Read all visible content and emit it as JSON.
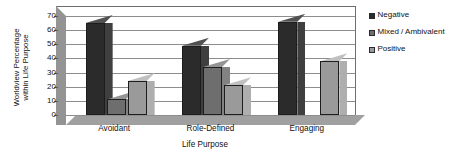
{
  "chart_data": {
    "type": "bar",
    "title": "",
    "subtitle": "",
    "xlabel": "Life Purpose",
    "ylabel_line1": "Worldview Percentage",
    "ylabel_line2": "within Life Purpose",
    "ylabel": "Worldview Percentage within Life Purpose",
    "categories": [
      "Avoidant",
      "Role-Defined",
      "Engaging"
    ],
    "series": [
      {
        "name": "Negative",
        "values": [
          65,
          49,
          66
        ],
        "color": "#2b2b2b"
      },
      {
        "name": "Mixed / Ambivalent",
        "values": [
          11,
          34,
          0
        ],
        "color": "#6e6e6e"
      },
      {
        "name": "Positive",
        "values": [
          24,
          21,
          38
        ],
        "color": "#9a9a9a"
      }
    ],
    "ylim": [
      0,
      70
    ],
    "yticks": [
      0,
      10,
      20,
      30,
      40,
      50,
      60,
      70
    ],
    "ytick_labels": [
      "0",
      "10",
      "20",
      "30",
      "40",
      "50",
      "60",
      "70"
    ],
    "grid": true,
    "grid_axis": "y",
    "legend_position": "right",
    "style": "3d-column",
    "plot_background": "#ffffff",
    "gridline_color": "#8d8d8d",
    "wall_color": "#949494",
    "floor_color": "#a0a0a0"
  },
  "legend": {
    "items": [
      {
        "label": "Negative",
        "color": "#2b2b2b"
      },
      {
        "label": "Mixed / Ambivalent",
        "color": "#6e6e6e"
      },
      {
        "label": "Positive",
        "color": "#9a9a9a"
      }
    ]
  },
  "axis": {
    "x_title": "Life Purpose",
    "y_title_line1": "Worldview Percentage",
    "y_title_line2": "within Life Purpose"
  }
}
